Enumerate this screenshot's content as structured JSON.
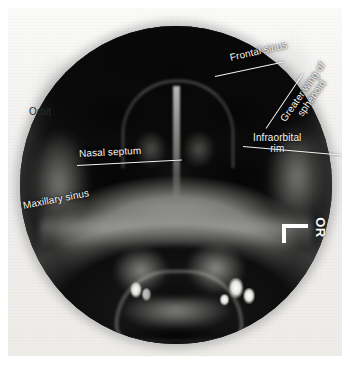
{
  "image": {
    "kind": "radiograph",
    "view": "occipitomental (Waters') projection of the paranasal sinuses",
    "background_color": "#ffffff",
    "film_color": "#f1f0ee",
    "field_shape": "circle",
    "field_color": "#0c0c0c",
    "label_color_light": "#f4f4f2",
    "label_color_dark": "#2b2b2b",
    "leader_color": "#f2f2f0"
  },
  "annotations": [
    {
      "id": "frontal-sinus",
      "text": "Frontal sinus",
      "style": "light",
      "rotation": -13
    },
    {
      "id": "greater-wing",
      "line1": "Greater wing of",
      "line2": "sphenoid",
      "style": "light",
      "rotation": -55
    },
    {
      "id": "infraorbital",
      "line1": "Infraorbital",
      "line2": "rim",
      "style": "light",
      "rotation": 0
    },
    {
      "id": "orbit",
      "text": "Orbit",
      "style": "dark",
      "rotation": 0
    },
    {
      "id": "nasal-septum",
      "text": "Nasal septum",
      "style": "light",
      "rotation": -3
    },
    {
      "id": "maxillary-sinus",
      "text": "Maxillary sinus",
      "style": "light",
      "rotation": -11
    }
  ],
  "side_marker": {
    "text": "OR",
    "rotation": 90,
    "bracket": "corner"
  }
}
